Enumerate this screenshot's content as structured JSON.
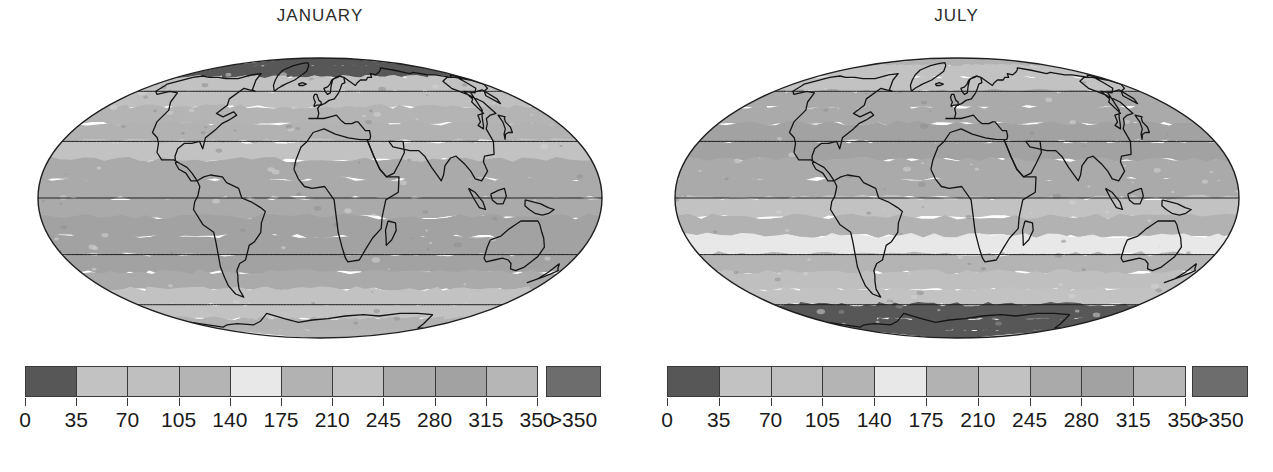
{
  "figure": {
    "background": "#ffffff",
    "width": 1273,
    "height": 472
  },
  "panels": [
    {
      "id": "january",
      "title": "JANUARY",
      "map": {
        "projection": "mollweide",
        "graticule": {
          "meridian_step_deg": 30,
          "parallel_step_deg": 30,
          "line_color": "#1f1f1f"
        },
        "coastline_color": "#141414",
        "outline_color": "#1f1f1f"
      }
    },
    {
      "id": "july",
      "title": "JULY",
      "map": {
        "projection": "mollweide",
        "graticule": {
          "meridian_step_deg": 30,
          "parallel_step_deg": 30,
          "line_color": "#1f1f1f"
        },
        "coastline_color": "#141414",
        "outline_color": "#1f1f1f"
      }
    }
  ],
  "chart_data": {
    "type": "heatmap",
    "title": "",
    "subtitle": "",
    "xlabel": "",
    "ylabel": "",
    "grid": true,
    "legend_position": "below",
    "maps": [
      {
        "name": "JANUARY",
        "projection": "mollweide",
        "latitude_band_values": [
          {
            "lat_center": 85,
            "value": 8
          },
          {
            "lat_center": 75,
            "value": 10
          },
          {
            "lat_center": 65,
            "value": 60
          },
          {
            "lat_center": 55,
            "value": 95
          },
          {
            "lat_center": 45,
            "value": 130
          },
          {
            "lat_center": 35,
            "value": 175
          },
          {
            "lat_center": 25,
            "value": 215
          },
          {
            "lat_center": 15,
            "value": 250
          },
          {
            "lat_center": 5,
            "value": 265
          },
          {
            "lat_center": -5,
            "value": 270
          },
          {
            "lat_center": -15,
            "value": 280
          },
          {
            "lat_center": -25,
            "value": 290
          },
          {
            "lat_center": -35,
            "value": 285
          },
          {
            "lat_center": -45,
            "value": 265
          },
          {
            "lat_center": -55,
            "value": 240
          },
          {
            "lat_center": -65,
            "value": 215
          },
          {
            "lat_center": -75,
            "value": 190
          },
          {
            "lat_center": -85,
            "value": 120
          }
        ]
      },
      {
        "name": "JULY",
        "projection": "mollweide",
        "latitude_band_values": [
          {
            "lat_center": 85,
            "value": 200
          },
          {
            "lat_center": 75,
            "value": 215
          },
          {
            "lat_center": 65,
            "value": 240
          },
          {
            "lat_center": 55,
            "value": 255
          },
          {
            "lat_center": 45,
            "value": 270
          },
          {
            "lat_center": 35,
            "value": 285
          },
          {
            "lat_center": 25,
            "value": 290
          },
          {
            "lat_center": 15,
            "value": 270
          },
          {
            "lat_center": 5,
            "value": 245
          },
          {
            "lat_center": -5,
            "value": 215
          },
          {
            "lat_center": -15,
            "value": 195
          },
          {
            "lat_center": -25,
            "value": 160
          },
          {
            "lat_center": -35,
            "value": 125
          },
          {
            "lat_center": -45,
            "value": 95
          },
          {
            "lat_center": -55,
            "value": 60
          },
          {
            "lat_center": -65,
            "value": 30
          },
          {
            "lat_center": -75,
            "value": 10
          },
          {
            "lat_center": -85,
            "value": 5
          }
        ]
      }
    ],
    "colorbar": {
      "tick_labels": [
        "0",
        "35",
        "70",
        "105",
        "140",
        "175",
        "210",
        "245",
        "280",
        "315",
        "350"
      ],
      "overflow_label": ">350",
      "bin_edges": [
        0,
        35,
        70,
        105,
        140,
        175,
        210,
        245,
        280,
        315,
        350
      ],
      "bin_colors": [
        "#575757",
        "#c2c2c2",
        "#bfbfbf",
        "#b4b4b4",
        "#e8e8e8",
        "#b2b2b2",
        "#c2c2c2",
        "#aaaaaa",
        "#a2a2a2",
        "#b6b6b6"
      ],
      "overflow_color": "#6d6d6d",
      "border_color": "#3a3a3a"
    }
  }
}
